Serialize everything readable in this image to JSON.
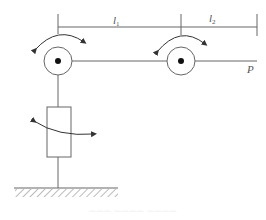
{
  "diagram": {
    "type": "robot-arm-kinematic-schematic",
    "labels": {
      "link1": "l",
      "link1_sub": "1",
      "link2": "l",
      "link2_sub": "2",
      "end_point": "P"
    },
    "components": [
      {
        "id": "base",
        "kind": "ground-hatch"
      },
      {
        "id": "waist-joint",
        "kind": "prismatic-rotary-cylinder",
        "motion": "rotation-arrow"
      },
      {
        "id": "shoulder-joint",
        "kind": "revolute-joint",
        "motion": "rotation-arrow"
      },
      {
        "id": "elbow-joint",
        "kind": "revolute-joint",
        "motion": "rotation-arrow"
      },
      {
        "id": "end-effector",
        "kind": "point",
        "label": "P"
      }
    ],
    "dimension_lines": [
      {
        "from": "shoulder-joint",
        "to": "elbow-joint",
        "label": "l1"
      },
      {
        "from": "elbow-joint",
        "to": "end-effector",
        "label": "l2"
      }
    ],
    "colors": {
      "stroke": "#555555",
      "background": "#ffffff"
    }
  },
  "caption": "——— ———— ————"
}
